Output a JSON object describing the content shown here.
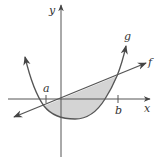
{
  "diagram": {
    "type": "area-between-curves",
    "axes": {
      "x_label": "x",
      "y_label": "y"
    },
    "curves": [
      {
        "name": "f",
        "label": "f",
        "kind": "line"
      },
      {
        "name": "g",
        "label": "g",
        "kind": "parabola"
      }
    ],
    "ticks": [
      {
        "label": "a"
      },
      {
        "label": "b"
      }
    ],
    "shaded_region": "area between f and g from a to b",
    "colors": {
      "stroke": "#555555",
      "fill": "#d4d4d4",
      "background": "#ffffff"
    }
  }
}
